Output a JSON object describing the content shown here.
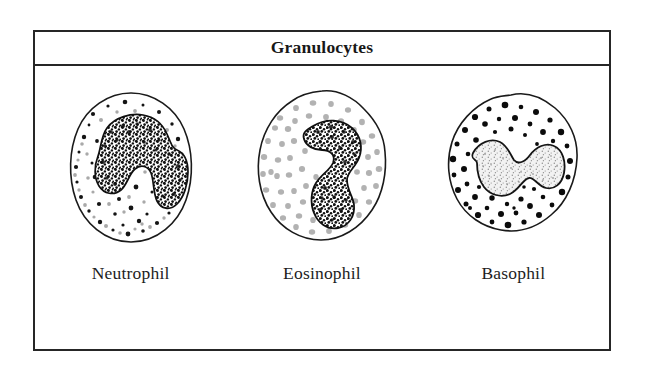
{
  "figure": {
    "type": "biology-illustration-table",
    "header": {
      "title": "Granulocytes"
    },
    "cells": [
      {
        "label": "Neutrophil",
        "icon_name": "neutrophil-cell-illustration",
        "nucleus": "multilobed-dark-stippled",
        "granule_style": "small-fine-dark-speckles",
        "granule_color": "#1a1a1a",
        "cytoplasm_color": "#ffffff",
        "membrane_color": "#1a1a1a"
      },
      {
        "label": "Eosinophil",
        "icon_name": "eosinophil-cell-illustration",
        "nucleus": "bilobed-dark-stippled",
        "granule_style": "large-pale-gray-granules",
        "granule_color": "#b4b4b4",
        "cytoplasm_color": "#ffffff",
        "membrane_color": "#1a1a1a"
      },
      {
        "label": "Basophil",
        "icon_name": "basophil-cell-illustration",
        "nucleus": "s-shaped-pale-stippled",
        "granule_style": "large-solid-black-granules",
        "granule_color": "#0d0d0d",
        "cytoplasm_color": "#ffffff",
        "membrane_color": "#1a1a1a"
      }
    ],
    "colors": {
      "border": "#262626",
      "background": "#ffffff",
      "text": "#1a1a1a"
    }
  }
}
